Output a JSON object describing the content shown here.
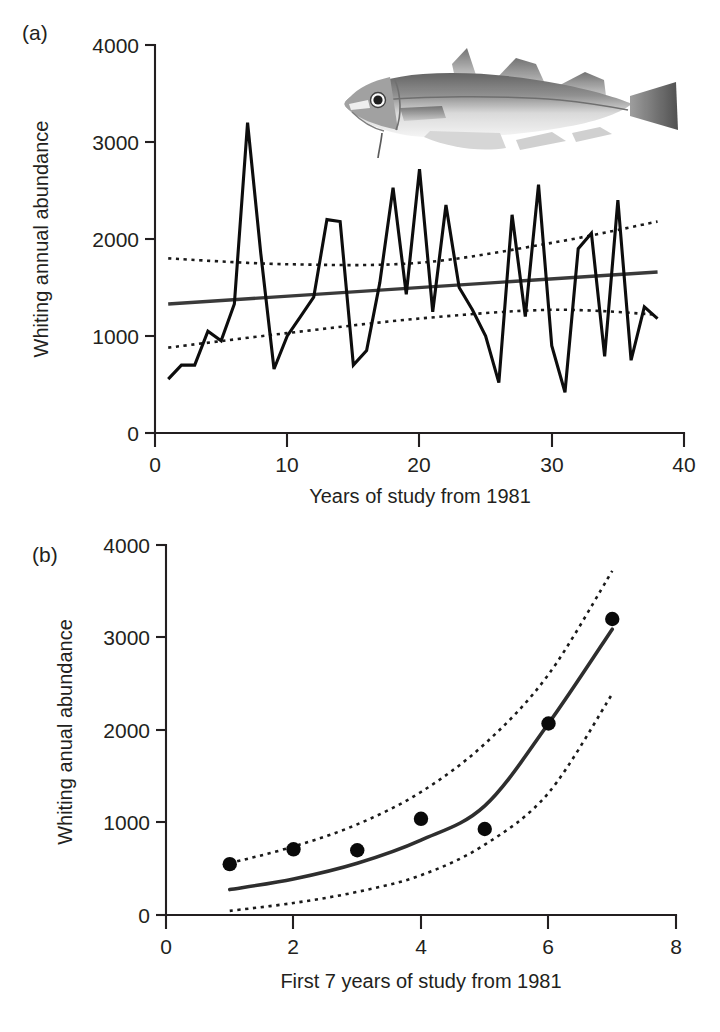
{
  "figure": {
    "panels": [
      {
        "label": "(a)",
        "ylabel": "Whiting annual abundance",
        "xlabel": "Years of study from 1981",
        "illustration": "whiting-fish-illustration"
      },
      {
        "label": "(b)",
        "ylabel": "Whiting anual abundance",
        "xlabel": "First 7 years of study from 1981"
      }
    ]
  },
  "chart_data": [
    {
      "type": "line",
      "panel": "(a)",
      "title": "",
      "xlabel": "Years of study from 1981",
      "ylabel": "Whiting annual abundance",
      "xlim": [
        0,
        40
      ],
      "ylim": [
        0,
        4000
      ],
      "xticks": [
        0,
        10,
        20,
        30,
        40
      ],
      "yticks": [
        0,
        1000,
        2000,
        3000,
        4000
      ],
      "grid": false,
      "legend": "none",
      "series": [
        {
          "name": "Whiting annual abundance",
          "style": "solid-black",
          "x": [
            1,
            2,
            3,
            4,
            5,
            6,
            7,
            8,
            9,
            10,
            11,
            12,
            13,
            14,
            15,
            16,
            17,
            18,
            19,
            20,
            21,
            22,
            23,
            24,
            25,
            26,
            27,
            28,
            29,
            30,
            31,
            32,
            33,
            34,
            35,
            36,
            37,
            38
          ],
          "values": [
            555,
            700,
            700,
            1050,
            950,
            1330,
            3200,
            1850,
            660,
            1000,
            1200,
            1400,
            2200,
            2180,
            700,
            850,
            1550,
            2530,
            1430,
            2720,
            1250,
            2350,
            1500,
            1270,
            1000,
            520,
            2250,
            1200,
            2560,
            900,
            420,
            1900,
            2060,
            790,
            2400,
            750,
            1300,
            1180
          ]
        },
        {
          "name": "Linear trend",
          "style": "solid-grey",
          "x": [
            1,
            38
          ],
          "values": [
            1330,
            1660
          ]
        },
        {
          "name": "Upper confidence limit",
          "style": "dotted",
          "x": [
            1,
            10,
            20,
            30,
            38
          ],
          "values": [
            1800,
            1740,
            1755,
            1960,
            2180
          ]
        },
        {
          "name": "Lower confidence limit",
          "style": "dotted",
          "x": [
            1,
            10,
            20,
            30,
            38
          ],
          "values": [
            880,
            1030,
            1180,
            1270,
            1220
          ]
        }
      ]
    },
    {
      "type": "scatter",
      "panel": "(b)",
      "title": "",
      "xlabel": "First 7 years of study from 1981",
      "ylabel": "Whiting anual abundance",
      "xlim": [
        0,
        8
      ],
      "ylim": [
        0,
        4000
      ],
      "xticks": [
        0,
        2,
        4,
        6,
        8
      ],
      "yticks": [
        0,
        1000,
        2000,
        3000,
        4000
      ],
      "grid": false,
      "legend": "none",
      "x": [
        1,
        2,
        3,
        4,
        5,
        6,
        7
      ],
      "values": [
        550,
        710,
        700,
        1040,
        930,
        2070,
        3200
      ],
      "series": [
        {
          "name": "Observed abundance",
          "style": "points",
          "x": [
            1,
            2,
            3,
            4,
            5,
            6,
            7
          ],
          "values": [
            550,
            710,
            700,
            1040,
            930,
            2070,
            3200
          ]
        },
        {
          "name": "Exponential fit",
          "style": "solid-curve",
          "x": [
            1,
            2,
            3,
            4,
            5,
            6,
            7
          ],
          "values": [
            275,
            390,
            560,
            810,
            1180,
            2070,
            3090
          ]
        },
        {
          "name": "Upper confidence limit",
          "style": "dotted",
          "x": [
            1,
            2,
            3,
            4,
            5,
            6,
            7
          ],
          "values": [
            560,
            740,
            980,
            1330,
            1850,
            2600,
            3720
          ]
        },
        {
          "name": "Lower confidence limit",
          "style": "dotted",
          "x": [
            1,
            2,
            3,
            4,
            5,
            6,
            7
          ],
          "values": [
            45,
            130,
            250,
            430,
            760,
            1320,
            2390
          ]
        }
      ]
    }
  ]
}
